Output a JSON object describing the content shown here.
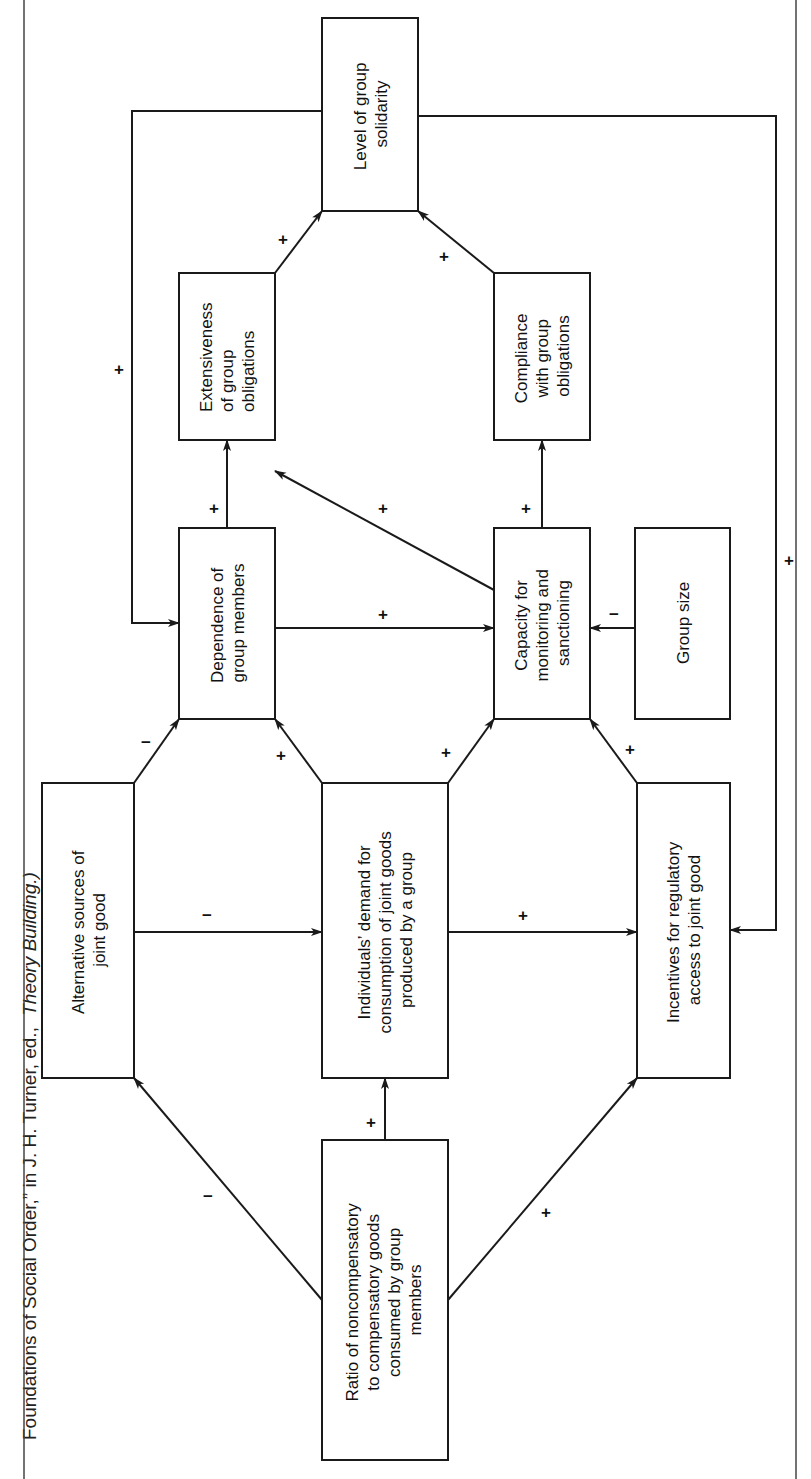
{
  "caption": {
    "text_plain": "Foundations of Social Order,” in J. H. Turner, ed.,",
    "text_italic": "Theory Building.)"
  },
  "nodes": {
    "ratio": {
      "lines": [
        "Ratio of noncompensatory",
        "to compensatory goods",
        "consumed by group",
        "members"
      ]
    },
    "alternative": {
      "lines": [
        "Alternative sources of",
        "joint good"
      ]
    },
    "demand": {
      "lines": [
        "Individuals’ demand for",
        "consumption of joint goods",
        "produced by a group"
      ]
    },
    "incentives": {
      "lines": [
        "Incentives for regulatory",
        "access to joint good"
      ]
    },
    "dependence": {
      "lines": [
        "Dependence of",
        "group members"
      ]
    },
    "capacity": {
      "lines": [
        "Capacity for",
        "monitoring and",
        "sanctioning"
      ]
    },
    "group_size": {
      "lines": [
        "Group size"
      ]
    },
    "extensiveness": {
      "lines": [
        "Extensiveness",
        "of group",
        "obligations"
      ]
    },
    "compliance": {
      "lines": [
        "Compliance",
        "with group",
        "obligations"
      ]
    },
    "solidarity": {
      "lines": [
        "Level of group",
        "solidarity"
      ]
    }
  },
  "edges": [
    {
      "from": "ratio",
      "to": "alternative",
      "sign": "−"
    },
    {
      "from": "ratio",
      "to": "demand",
      "sign": "+"
    },
    {
      "from": "ratio",
      "to": "incentives",
      "sign": "+"
    },
    {
      "from": "alternative",
      "to": "demand",
      "sign": "−"
    },
    {
      "from": "demand",
      "to": "incentives",
      "sign": "+"
    },
    {
      "from": "alternative",
      "to": "dependence",
      "sign": "−"
    },
    {
      "from": "demand",
      "to": "dependence",
      "sign": "+"
    },
    {
      "from": "demand",
      "to": "capacity",
      "sign": "+"
    },
    {
      "from": "incentives",
      "to": "capacity",
      "sign": "+"
    },
    {
      "from": "dependence",
      "to": "capacity",
      "sign": "+"
    },
    {
      "from": "group_size",
      "to": "capacity",
      "sign": "−"
    },
    {
      "from": "dependence",
      "to": "extensiveness",
      "sign": "+"
    },
    {
      "from": "capacity",
      "to": "extensiveness",
      "sign": "+"
    },
    {
      "from": "capacity",
      "to": "compliance",
      "sign": "+"
    },
    {
      "from": "extensiveness",
      "to": "solidarity",
      "sign": "+"
    },
    {
      "from": "compliance",
      "to": "solidarity",
      "sign": "+"
    },
    {
      "from": "solidarity",
      "to": "dependence",
      "sign": "+"
    },
    {
      "from": "solidarity",
      "to": "incentives",
      "sign": "+"
    }
  ],
  "signs": {
    "ratio_alternative": "−",
    "ratio_demand": "+",
    "ratio_incentives": "+",
    "alternative_demand": "−",
    "demand_incentives": "+",
    "alternative_dependence": "−",
    "demand_dependence": "+",
    "demand_capacity": "+",
    "incentives_capacity": "+",
    "dependence_capacity": "+",
    "groupsize_capacity": "−",
    "dependence_extensiveness": "+",
    "capacity_extensiveness": "+",
    "capacity_compliance": "+",
    "extensiveness_solidarity": "+",
    "compliance_solidarity": "+",
    "solidarity_dependence": "+",
    "solidarity_incentives": "+"
  }
}
